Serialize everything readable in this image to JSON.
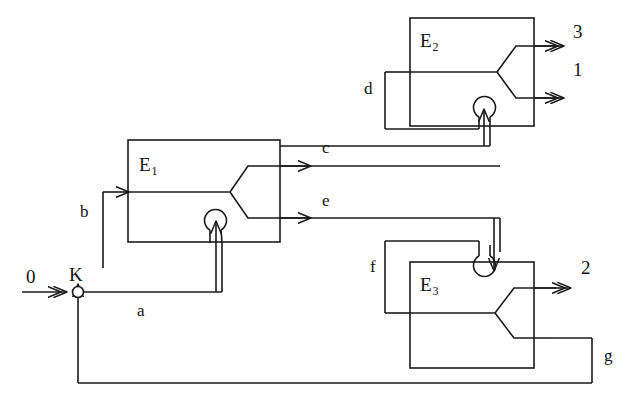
{
  "diagram": {
    "type": "block-diagram",
    "stroke_color": "#1a1a1a",
    "background_color": "#ffffff",
    "stroke_width": 1.6,
    "elements": [
      {
        "id": "E1",
        "label": "E",
        "subscript": "1",
        "x": 128,
        "y": 140,
        "width": 152,
        "height": 102
      },
      {
        "id": "E2",
        "label": "E",
        "subscript": "2",
        "x": 410,
        "y": 18,
        "width": 124,
        "height": 108
      },
      {
        "id": "E3",
        "label": "E",
        "subscript": "3",
        "x": 410,
        "y": 262,
        "width": 124,
        "height": 106
      }
    ],
    "ports": [
      {
        "name": "0",
        "kind": "input",
        "x": 30,
        "y": 277
      },
      {
        "name": "K",
        "kind": "junction",
        "x": 69,
        "y": 268
      },
      {
        "name": "3",
        "kind": "output",
        "x": 573,
        "y": 26
      },
      {
        "name": "1",
        "kind": "output",
        "x": 573,
        "y": 63
      },
      {
        "name": "2",
        "kind": "output",
        "x": 581,
        "y": 258
      }
    ],
    "signals": [
      {
        "name": "a",
        "x": 137,
        "y": 302,
        "from": "K",
        "to": "E1-feedback"
      },
      {
        "name": "b",
        "x": 80,
        "y": 203,
        "from": "a-branch",
        "to": "E1-input"
      },
      {
        "name": "c",
        "x": 322,
        "y": 139,
        "from": "E1-output-top",
        "to": "E2-feedback"
      },
      {
        "name": "d",
        "x": 364,
        "y": 80,
        "from": "c-branch",
        "to": "E2-input"
      },
      {
        "name": "e",
        "x": 322,
        "y": 197,
        "from": "E1-output-bottom",
        "to": "E3-feedback"
      },
      {
        "name": "f",
        "x": 370,
        "y": 258,
        "from": "e-branch",
        "to": "E3-input"
      },
      {
        "name": "g",
        "x": 604,
        "y": 347,
        "from": "E3-output-bottom",
        "to": "K"
      }
    ]
  }
}
